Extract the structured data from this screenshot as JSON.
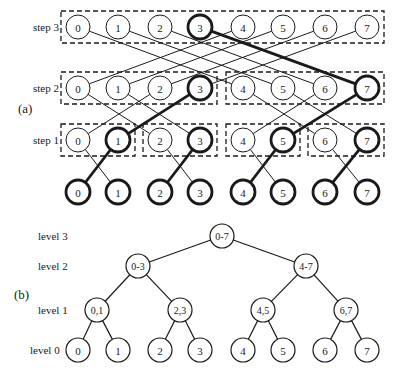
{
  "panel_a": {
    "label": "(a)",
    "rows": [
      {
        "name": "step 3",
        "y": 27,
        "bold": [
          3
        ],
        "boxes": [
          [
            0,
            7
          ]
        ]
      },
      {
        "name": "step 2",
        "y": 88,
        "bold": [
          3,
          7
        ],
        "boxes": [
          [
            0,
            3
          ],
          [
            4,
            7
          ]
        ]
      },
      {
        "name": "step 1",
        "y": 140,
        "bold": [
          1,
          3,
          5,
          7
        ],
        "boxes": [
          [
            0,
            1
          ],
          [
            2,
            3
          ],
          [
            4,
            5
          ],
          [
            6,
            7
          ]
        ]
      },
      {
        "name": "",
        "y": 192,
        "bold": [
          0,
          1,
          2,
          3,
          4,
          5,
          6,
          7
        ],
        "boxes": []
      }
    ],
    "node_labels": [
      "0",
      "1",
      "2",
      "3",
      "4",
      "5",
      "6",
      "7"
    ],
    "node_x": [
      78,
      118,
      160,
      200,
      243,
      283,
      325,
      367
    ],
    "connections": [
      {
        "from_row": 3,
        "to_row": 2,
        "xor": 1,
        "bold_edges": [
          [
            0,
            1
          ],
          [
            2,
            3
          ],
          [
            4,
            5
          ],
          [
            6,
            7
          ]
        ]
      },
      {
        "from_row": 2,
        "to_row": 1,
        "xor": 2,
        "bold_edges": [
          [
            1,
            3
          ],
          [
            5,
            7
          ]
        ]
      },
      {
        "from_row": 1,
        "to_row": 0,
        "xor": 4,
        "bold_edges": [
          [
            7,
            3
          ]
        ]
      }
    ]
  },
  "panel_b": {
    "label": "(b)",
    "levels": [
      {
        "name": "level 3",
        "y": 236,
        "nodes": [
          {
            "label": "0-7",
            "x": 222
          }
        ]
      },
      {
        "name": "level 2",
        "y": 266,
        "nodes": [
          {
            "label": "0-3",
            "x": 138
          },
          {
            "label": "4-7",
            "x": 306
          }
        ]
      },
      {
        "name": "level 1",
        "y": 310,
        "nodes": [
          {
            "label": "0,1",
            "x": 97
          },
          {
            "label": "2,3",
            "x": 180
          },
          {
            "label": "4,5",
            "x": 263
          },
          {
            "label": "6,7",
            "x": 346
          }
        ]
      },
      {
        "name": "level 0",
        "y": 350,
        "nodes": [
          {
            "label": "0",
            "x": 78
          },
          {
            "label": "1",
            "x": 118
          },
          {
            "label": "2",
            "x": 160
          },
          {
            "label": "3",
            "x": 200
          },
          {
            "label": "4",
            "x": 243
          },
          {
            "label": "5",
            "x": 283
          },
          {
            "label": "6",
            "x": 325
          },
          {
            "label": "7",
            "x": 367
          }
        ]
      }
    ]
  },
  "style": {
    "ink": "#1a1a1a",
    "node_radius": 12,
    "thin": 1,
    "thick": 2.8
  }
}
